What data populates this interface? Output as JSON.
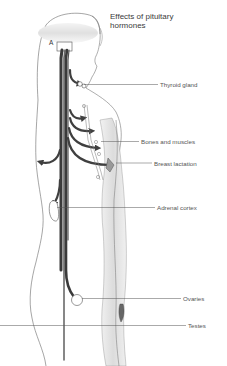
{
  "title": "Effects of pituitary\nhormones",
  "marker": "A",
  "labels": [
    {
      "id": "thyroid",
      "text": "Thyroid gland",
      "x": 160,
      "y": 81,
      "line_x1": 84,
      "line_y": 84.5
    },
    {
      "id": "bones",
      "text": "Bones and muscles",
      "x": 141,
      "y": 138,
      "line_x1": 101,
      "line_y": 141.5
    },
    {
      "id": "breast",
      "text": "Breast lactation",
      "x": 154,
      "y": 159,
      "line_x1": 116,
      "line_y": 163
    },
    {
      "id": "adrenal",
      "text": "Adrenal cortex",
      "x": 157,
      "y": 204,
      "line_x1": 57,
      "line_y": 207.5
    },
    {
      "id": "ovaries",
      "text": "Ovaries",
      "x": 183,
      "y": 295,
      "line_x1": 82,
      "line_y": 298.5
    },
    {
      "id": "testes",
      "text": "Testes",
      "x": 188,
      "y": 322,
      "line_x1": 0,
      "line_y": 325.5
    }
  ],
  "colors": {
    "line": "#555555",
    "arrow": "#3f3f3f",
    "outline": "#6a6a6a",
    "shade": "#e2e2e2"
  }
}
